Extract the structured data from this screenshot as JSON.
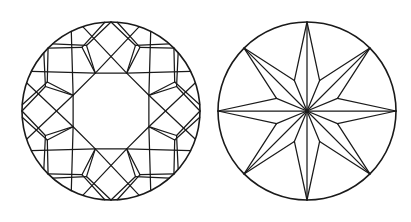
{
  "document": {
    "title": "Round Brilliant Cut — Crown and Pavilion Views",
    "background_color": "#ffffff",
    "line_color": "#1a1a1a",
    "width": 411,
    "height": 222
  },
  "figures": [
    {
      "name": "crown-view",
      "label": "Crown view",
      "center_x": 111,
      "center_y": 111,
      "girdle_radius": 89,
      "table_radius": 41,
      "star_tip_radius": 60,
      "bezel_point_radius": 70,
      "facet_counts": {
        "table": 1,
        "bezel_kite_facets": 8,
        "star_facets": 8,
        "upper_girdle_halves": 16,
        "total": 33
      },
      "rotation_degrees": 0
    },
    {
      "name": "pavilion-view",
      "label": "Pavilion view",
      "center_x": 307,
      "center_y": 111,
      "girdle_radius": 89,
      "culet_radius": 1.5,
      "star_inner_radius": 33,
      "facet_counts": {
        "pavilion_mains": 8,
        "lower_girdle_halves": 16,
        "culet": 1,
        "total": 25
      },
      "rotation_degrees": 0
    }
  ],
  "chart_data": {
    "type": "diagram",
    "panels": [
      {
        "name": "crown-view",
        "description": "Plan view of the crown showing girdle outline, octagonal table, eight bezel kite facets, eight star facets and sixteen upper-girdle half facets whose edges cross to form a pinwheel star.",
        "elements": [
          "girdle-circle",
          "table-octagon",
          "bezel-kite-facets",
          "star-facets",
          "upper-girdle-halves"
        ]
      },
      {
        "name": "pavilion-view",
        "description": "Plan view of the pavilion showing girdle outline, a point culet at center, eight long pavilion main facets reaching the girdle and sixteen lower-girdle half facets forming an eight-pointed star.",
        "elements": [
          "girdle-circle",
          "culet-point",
          "pavilion-main-facets",
          "lower-girdle-halves"
        ]
      }
    ]
  }
}
